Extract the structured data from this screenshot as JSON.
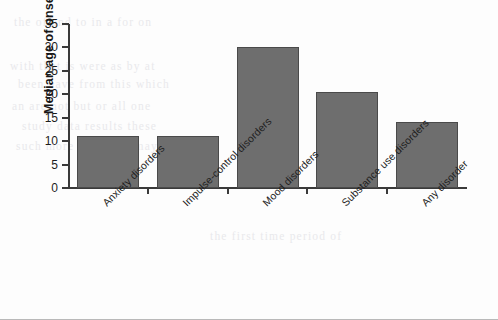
{
  "chart_data": {
    "type": "bar",
    "title": "",
    "xlabel": "",
    "ylabel": "Median age of onset",
    "categories": [
      "Anxiety disorders",
      "Impulse-control disorders",
      "Mood disorders",
      "Substance use disorders",
      "Any disorder"
    ],
    "values": [
      11,
      11,
      30,
      20.5,
      14
    ],
    "ylim": [
      0,
      35
    ],
    "ytick_labels": [
      "0",
      "5",
      "10",
      "15",
      "20",
      "25",
      "30",
      "35"
    ],
    "ytick_values": [
      0,
      5,
      10,
      15,
      20,
      25,
      30,
      35
    ],
    "grid": false,
    "legend": false,
    "bar_color": "#6e6e6e",
    "bar_border_color": "#4a4a4a",
    "axis_color": "#3a3a3a",
    "background": "#fdfdfd"
  },
  "scan_artifacts": {
    "ghost_text": [
      "the of and to in a for on",
      "with that is were as by at",
      "been have from this which",
      "an are not but or all one",
      "study data results these",
      "such more than also may",
      "the first time period of"
    ]
  }
}
